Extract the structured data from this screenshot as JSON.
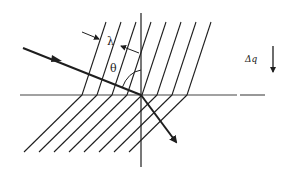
{
  "diagram": {
    "labels": {
      "wavelength": "λ",
      "angle": "θ",
      "delta_q": "Δq"
    },
    "colors": {
      "ink": "#1e1e1e",
      "background": "#ffffff"
    },
    "elements": {
      "incident_ray": "incoming wave vector arrow",
      "refracted_ray": "outgoing wave vector arrow",
      "wavefronts_upper": 8,
      "wavefronts_lower": 8,
      "interface": "horizontal boundary line",
      "normal": "vertical normal axis"
    }
  }
}
